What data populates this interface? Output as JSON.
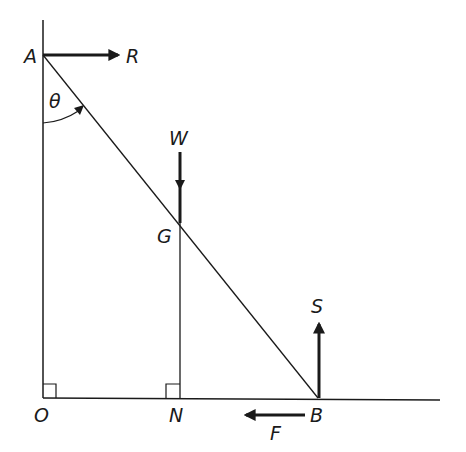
{
  "diagram": {
    "points": {
      "A": "A",
      "B": "B",
      "G": "G",
      "O": "O",
      "N": "N"
    },
    "forces": {
      "R": "R",
      "W": "W",
      "S": "S",
      "F": "F"
    },
    "angle": "θ",
    "colors": {
      "ink": "#1a1a1a",
      "background": "#ffffff"
    }
  }
}
